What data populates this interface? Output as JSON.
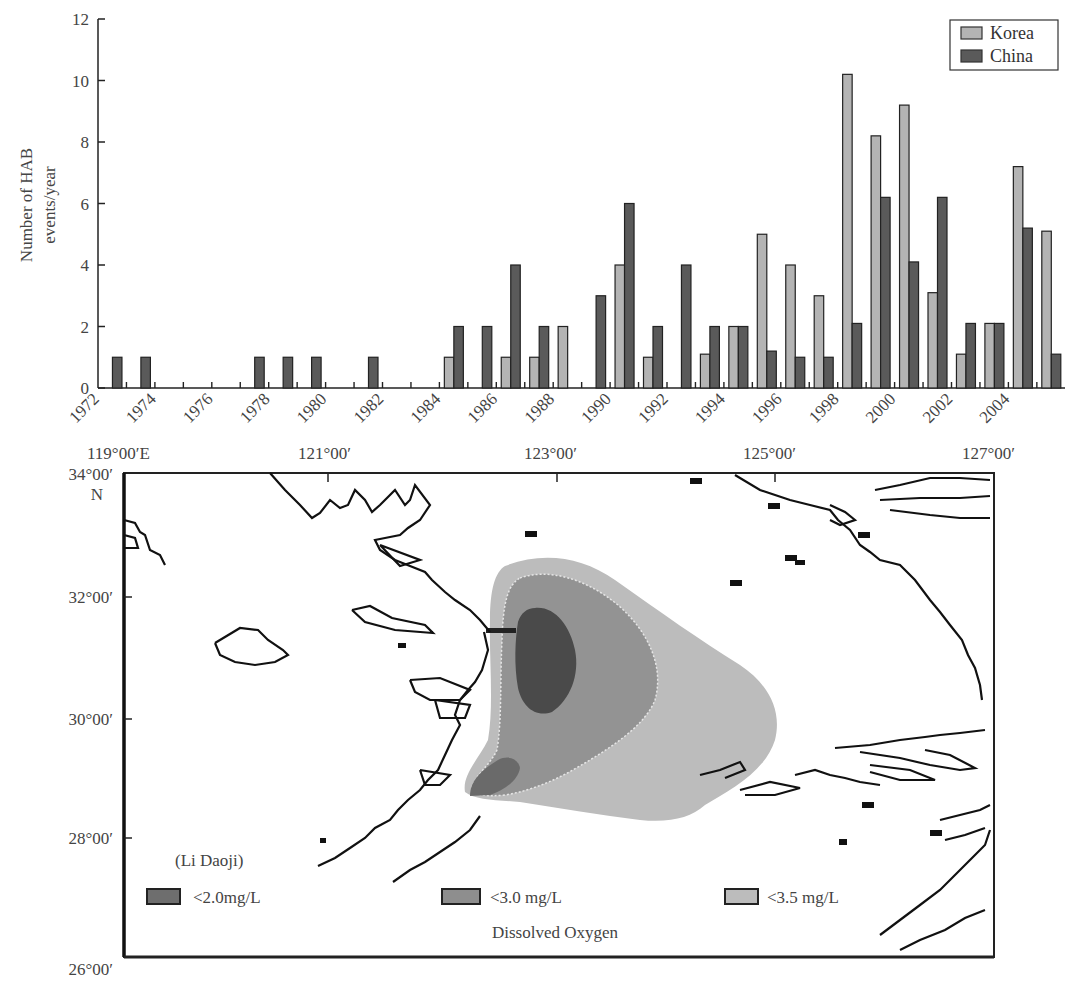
{
  "chart_data": {
    "type": "bar",
    "title": "",
    "xlabel": "",
    "ylabel": "Number of HAB events/year",
    "ylabel_lines": [
      "Number of HAB",
      "events/year"
    ],
    "ylim": [
      0,
      12
    ],
    "yticks": [
      0,
      2,
      4,
      6,
      8,
      10,
      12
    ],
    "xticks_labels": [
      "1972",
      "1974",
      "1976",
      "1978",
      "1980",
      "1982",
      "1984",
      "1986",
      "1988",
      "1990",
      "1992",
      "1994",
      "1996",
      "1998",
      "2000",
      "2002",
      "2004"
    ],
    "grid": false,
    "legend_position": "upper right",
    "categories": [
      1972,
      1973,
      1974,
      1975,
      1976,
      1977,
      1978,
      1979,
      1980,
      1981,
      1982,
      1983,
      1984,
      1985,
      1986,
      1987,
      1988,
      1989,
      1990,
      1991,
      1992,
      1993,
      1994,
      1995,
      1996,
      1997,
      1998,
      1999,
      2000,
      2001,
      2002,
      2003,
      2004,
      2005
    ],
    "series": [
      {
        "name": "Korea",
        "color": "#b4b4b4",
        "values": [
          0,
          0,
          0,
          0,
          0,
          0,
          0,
          0,
          0,
          0,
          0,
          0,
          1,
          0,
          1,
          1,
          2,
          0,
          4,
          1,
          0,
          1.1,
          2,
          5,
          4,
          3,
          10.2,
          8.2,
          9.2,
          3.1,
          1.1,
          2.1,
          7.2,
          5.1
        ]
      },
      {
        "name": "China",
        "color": "#5a5a5a",
        "values": [
          1,
          1,
          0,
          0,
          0,
          1,
          1,
          1,
          0,
          1,
          0,
          0,
          2,
          2,
          4,
          2,
          0,
          3,
          6,
          2,
          4,
          2,
          2,
          1.2,
          1,
          1,
          2.1,
          6.2,
          4.1,
          6.2,
          2.1,
          2.1,
          5.2,
          1.1
        ]
      }
    ]
  },
  "chart": {
    "legend": [
      {
        "label": "Korea",
        "color": "#b4b4b4"
      },
      {
        "label": "China",
        "color": "#5a5a5a"
      }
    ]
  },
  "map": {
    "longitude_labels": [
      "119°00′E",
      "121°00′",
      "123°00′",
      "125°00′",
      "127°00′"
    ],
    "latitude_labels": [
      "34°00′",
      "32°00′",
      "30°00′",
      "28°00′",
      "26°00′"
    ],
    "north_label": "N",
    "source_label": "(Li Daoji)",
    "caption": "Dissolved Oxygen",
    "legend": [
      {
        "label": "<2.0mg/L",
        "color": "#6e6e6e"
      },
      {
        "label": "<3.0 mg/L",
        "color": "#8e8e8e"
      },
      {
        "label": "<3.5 mg/L",
        "color": "#bcbcbc"
      }
    ]
  }
}
